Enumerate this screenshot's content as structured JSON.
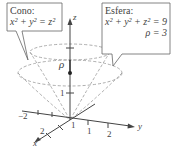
{
  "callouts": {
    "cone": {
      "title": "Cono:",
      "equation": "x² + y² = z²"
    },
    "sphere": {
      "title": "Esfera:",
      "equation": "x² + y² + z² = 9",
      "rho": "ρ = 3"
    }
  },
  "axes": {
    "z_label": "z",
    "y_label": "y",
    "x_label": "x",
    "rho_label": "ρ",
    "ticks": {
      "z_1": "1",
      "y_neg2": "−2",
      "y_1": "1",
      "y_2": "2",
      "x_1": "1",
      "x_2": "2"
    }
  },
  "colors": {
    "line": "#444444",
    "dash": "#888888",
    "callout_border": "#666666"
  }
}
